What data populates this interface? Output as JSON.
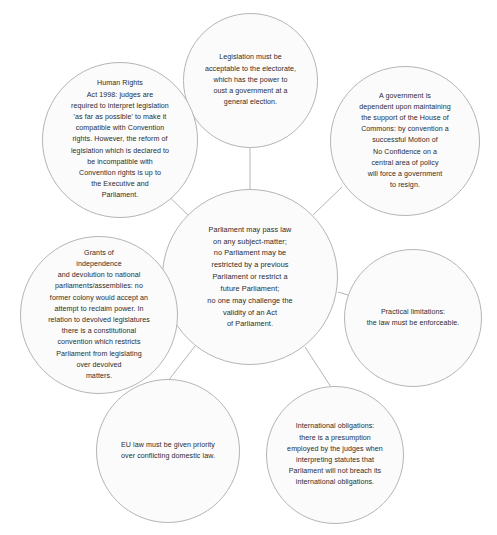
{
  "diagram": {
    "type": "hub-and-spoke-circles",
    "background_color": "#ffffff",
    "circle_fill": "#fbfbfb",
    "circle_stroke": "#b5b5b5",
    "connector_color": "#b5b5b5",
    "text_color": "#2b2b2b",
    "center": {
      "id": "parliament-sovereignty",
      "text": "Parliament may pass law\non any subject-matter;\nno Parliament may be\nrestricted by a previous\nParliament or restrict a\nfuture Parliament;\nno one may challenge the\nvalidity of an Act\nof Parliament."
    },
    "nodes": [
      {
        "id": "legislation-electorate",
        "position": "top",
        "text": "Legislation must be\nacceptable to the electorate,\nwhich has the power to\noust a government at a\ngeneral election."
      },
      {
        "id": "human-rights-act",
        "position": "top-left",
        "text": "Human Rights\nAct 1998: judges are\nrequired to interpret legislation\n'as far as possible' to make it\ncompatible with Convention\nrights. However, the reform of\nlegislation which is declared to\nbe incompatible with\nConvention rights is up to\nthe Executive and\nParliament."
      },
      {
        "id": "government-confidence",
        "position": "top-right",
        "text": "A government is\ndependent upon maintaining\nthe support of the House of\nCommons: by convention a\nsuccessful Motion of\nNo Confidence on a\ncentral area of policy\nwill force a government\nto resign."
      },
      {
        "id": "grants-of-independence",
        "position": "left",
        "text": "Grants of\nindependence\nand devolution to national\nparliaments/assemblies: no\nformer colony would accept an\nattempt to reclaim power. In\nrelation to devolved legislatures\nthere is a constitutional\nconvention which restricts\nParliament from legislating\nover devolved\nmatters."
      },
      {
        "id": "practical-limitations",
        "position": "right",
        "text": "Practical limitations:\nthe law must be enforceable."
      },
      {
        "id": "eu-law-priority",
        "position": "bottom-left",
        "text": "EU law must be given priority\nover conflicting domestic law."
      },
      {
        "id": "international-obligations",
        "position": "bottom-right",
        "text": "International obligations:\nthere is a presumption\nemployed by the judges when\ninterpreting statutes that\nParliament will not breach its\ninternational obligations."
      }
    ]
  }
}
